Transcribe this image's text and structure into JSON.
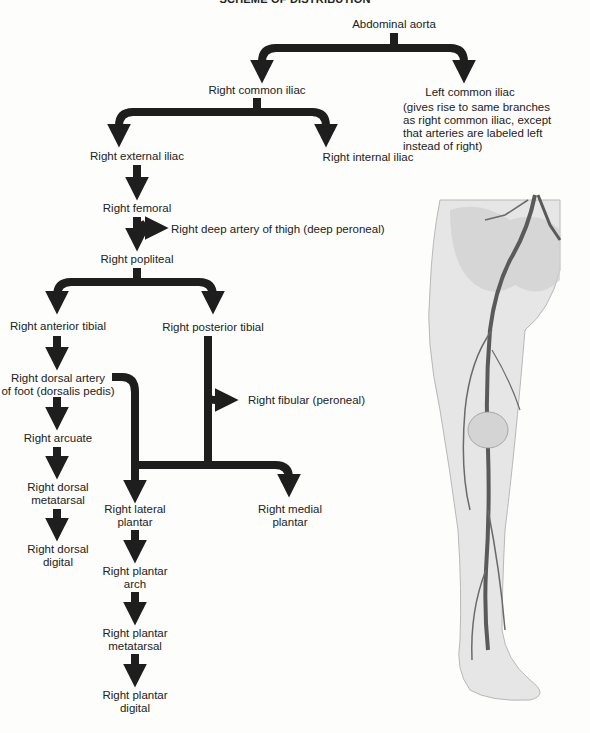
{
  "title": "SCHEME OF DISTRIBUTION",
  "nodes": {
    "abdominal_aorta": "Abdominal aorta",
    "right_common_iliac": "Right common iliac",
    "left_common_iliac": "Left common iliac",
    "left_common_iliac_note": [
      "(gives rise to same branches",
      "as right common iliac, except",
      "that arteries are labeled left",
      "instead of right)"
    ],
    "right_external_iliac": "Right external iliac",
    "right_internal_iliac": "Right internal iliac",
    "right_femoral": "Right femoral",
    "right_deep_artery_thigh": "Right deep artery of thigh (deep peroneal)",
    "right_popliteal": "Right popliteal",
    "right_anterior_tibial": "Right anterior tibial",
    "right_posterior_tibial": "Right posterior tibial",
    "right_dorsal_artery_foot": [
      "Right dorsal artery",
      "of foot (dorsalis pedis)"
    ],
    "right_fibular": "Right fibular (peroneal)",
    "right_arcuate": "Right arcuate",
    "right_dorsal_metatarsal": [
      "Right dorsal",
      "metatarsal"
    ],
    "right_dorsal_digital": [
      "Right dorsal",
      "digital"
    ],
    "right_lateral_plantar": [
      "Right lateral",
      "plantar"
    ],
    "right_medial_plantar": [
      "Right medial",
      "plantar"
    ],
    "right_plantar_arch": [
      "Right plantar",
      "arch"
    ],
    "right_plantar_metatarsal": [
      "Right plantar",
      "metatarsal"
    ],
    "right_plantar_digital": [
      "Right plantar",
      "digital"
    ]
  },
  "illustration": {
    "subject": "leg-arteries-illustration"
  },
  "colors": {
    "arrow": "#1e1e1e",
    "text": "#222222",
    "background": "#fdfdfc"
  }
}
